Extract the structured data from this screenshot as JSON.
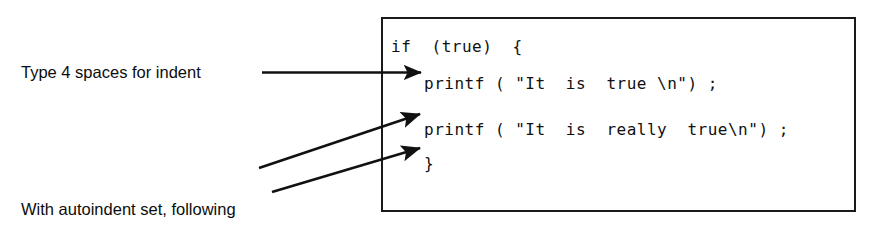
{
  "figure": {
    "background_color": "#ffffff",
    "ink_color": "#111111"
  },
  "code_box": {
    "border_color": "#1a1a1a",
    "lines": [
      "if  (true)  {",
      "printf ( \"It  is  true \\n\") ;",
      "printf ( \"It  is  really  true\\n\") ;",
      "}"
    ]
  },
  "annotations": {
    "indent": {
      "text": "Type 4 spaces for indent",
      "arrow": "horizontal-arrow-to-line-2"
    },
    "autoindent": {
      "line1": "With autoindent set, following",
      "line2": "lines are automatically indented.",
      "arrow_1": "diagonal-arrow-to-line-3",
      "arrow_2": "diagonal-arrow-to-closing-brace"
    }
  }
}
